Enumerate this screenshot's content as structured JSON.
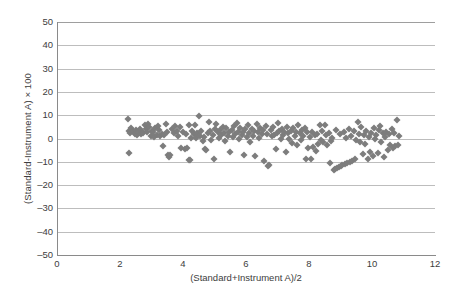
{
  "chart_data": {
    "type": "scatter",
    "title": "",
    "xlabel": "(Standard+Instrument A)/2",
    "ylabel": "(Standard-Instrument A) × 100",
    "xlim": [
      0,
      12
    ],
    "ylim": [
      -50,
      50
    ],
    "xticks": [
      0,
      2,
      4,
      6,
      8,
      10,
      12
    ],
    "yticks": [
      50,
      40,
      30,
      20,
      10,
      0,
      -10,
      -20,
      -30,
      -40,
      -50
    ],
    "xtick_labels": [
      "0",
      "2",
      "4",
      "6",
      "8",
      "10",
      "12"
    ],
    "ytick_labels": [
      "50",
      "40",
      "30",
      "20",
      "10",
      "0",
      "–10",
      "–20",
      "–30",
      "–40",
      "–50"
    ],
    "grid": "horizontal",
    "legend": "none",
    "marker": "diamond",
    "marker_color": "#7d7d7d",
    "marker_size": 5,
    "background": "#ffffff",
    "gridline_color": "#bdbdbd",
    "axis_color": "#8a8a8a",
    "n_points": 201,
    "points": [
      [
        2.25,
        8.4
      ],
      [
        2.28,
        3.1
      ],
      [
        2.31,
        2.4
      ],
      [
        2.35,
        4.6
      ],
      [
        2.3,
        -6.4
      ],
      [
        2.42,
        3.3
      ],
      [
        2.47,
        2.0
      ],
      [
        2.52,
        3.6
      ],
      [
        2.55,
        1.4
      ],
      [
        2.58,
        2.8
      ],
      [
        2.63,
        4.2
      ],
      [
        2.66,
        1.8
      ],
      [
        2.7,
        3.0
      ],
      [
        2.74,
        2.2
      ],
      [
        2.78,
        5.9
      ],
      [
        2.82,
        3.9
      ],
      [
        2.86,
        2.6
      ],
      [
        2.9,
        6.3
      ],
      [
        2.93,
        5.1
      ],
      [
        2.97,
        1.1
      ],
      [
        3.0,
        3.4
      ],
      [
        3.04,
        2.9
      ],
      [
        3.08,
        0.6
      ],
      [
        3.12,
        4.4
      ],
      [
        3.16,
        1.6
      ],
      [
        3.2,
        5.2
      ],
      [
        3.24,
        3.7
      ],
      [
        3.28,
        0.9
      ],
      [
        3.33,
        2.1
      ],
      [
        3.37,
        -3.2
      ],
      [
        3.41,
        1.3
      ],
      [
        3.45,
        6.2
      ],
      [
        3.48,
        3.0
      ],
      [
        3.52,
        -7.2
      ],
      [
        3.56,
        -7.8
      ],
      [
        3.6,
        -6.9
      ],
      [
        3.65,
        4.0
      ],
      [
        3.7,
        2.3
      ],
      [
        3.75,
        5.4
      ],
      [
        3.8,
        3.2
      ],
      [
        3.85,
        1.0
      ],
      [
        3.9,
        4.8
      ],
      [
        3.95,
        -4.0
      ],
      [
        4.0,
        2.7
      ],
      [
        4.05,
        -4.6
      ],
      [
        4.1,
        1.9
      ],
      [
        4.14,
        -4.2
      ],
      [
        4.18,
        6.0
      ],
      [
        4.2,
        -9.4
      ],
      [
        4.22,
        -9.1
      ],
      [
        4.26,
        0.2
      ],
      [
        4.3,
        3.1
      ],
      [
        4.34,
        2.0
      ],
      [
        4.38,
        5.6
      ],
      [
        4.42,
        0.4
      ],
      [
        4.46,
        2.5
      ],
      [
        4.5,
        9.5
      ],
      [
        4.54,
        1.2
      ],
      [
        4.58,
        3.3
      ],
      [
        4.62,
        -1.1
      ],
      [
        4.66,
        0.8
      ],
      [
        4.7,
        -4.4
      ],
      [
        4.74,
        -5.0
      ],
      [
        4.78,
        2.2
      ],
      [
        4.82,
        7.1
      ],
      [
        4.86,
        3.4
      ],
      [
        4.9,
        -0.6
      ],
      [
        4.94,
        1.5
      ],
      [
        4.98,
        -8.6
      ],
      [
        5.02,
        4.1
      ],
      [
        5.06,
        6.4
      ],
      [
        5.1,
        2.8
      ],
      [
        5.14,
        0.1
      ],
      [
        5.18,
        3.6
      ],
      [
        5.22,
        1.7
      ],
      [
        5.26,
        5.0
      ],
      [
        5.3,
        2.4
      ],
      [
        5.34,
        -0.9
      ],
      [
        5.38,
        4.3
      ],
      [
        5.42,
        1.0
      ],
      [
        5.46,
        2.9
      ],
      [
        5.5,
        -5.7
      ],
      [
        5.54,
        3.8
      ],
      [
        5.58,
        0.5
      ],
      [
        5.62,
        5.3
      ],
      [
        5.66,
        2.1
      ],
      [
        5.7,
        6.6
      ],
      [
        5.74,
        3.0
      ],
      [
        5.78,
        -0.3
      ],
      [
        5.82,
        4.5
      ],
      [
        5.86,
        1.4
      ],
      [
        5.9,
        2.6
      ],
      [
        5.94,
        -6.9
      ],
      [
        5.98,
        3.9
      ],
      [
        6.02,
        0.7
      ],
      [
        6.06,
        5.8
      ],
      [
        6.1,
        2.3
      ],
      [
        6.14,
        -1.6
      ],
      [
        6.18,
        4.0
      ],
      [
        6.22,
        1.1
      ],
      [
        6.26,
        3.2
      ],
      [
        6.3,
        -7.4
      ],
      [
        6.34,
        6.1
      ],
      [
        6.38,
        2.7
      ],
      [
        6.42,
        0.3
      ],
      [
        6.46,
        4.7
      ],
      [
        6.5,
        1.8
      ],
      [
        6.54,
        3.5
      ],
      [
        6.58,
        -9.8
      ],
      [
        6.62,
        5.5
      ],
      [
        6.66,
        2.0
      ],
      [
        6.7,
        -11.6
      ],
      [
        6.74,
        -11.2
      ],
      [
        6.78,
        3.7
      ],
      [
        6.82,
        0.9
      ],
      [
        6.86,
        4.9
      ],
      [
        6.9,
        1.3
      ],
      [
        6.94,
        -4.3
      ],
      [
        6.98,
        2.5
      ],
      [
        7.02,
        6.8
      ],
      [
        7.06,
        3.1
      ],
      [
        7.1,
        -0.4
      ],
      [
        7.14,
        4.2
      ],
      [
        7.18,
        1.6
      ],
      [
        7.22,
        2.8
      ],
      [
        7.26,
        -6.0
      ],
      [
        7.3,
        5.1
      ],
      [
        7.34,
        2.2
      ],
      [
        7.38,
        0.0
      ],
      [
        7.42,
        3.4
      ],
      [
        7.46,
        -1.9
      ],
      [
        7.5,
        4.6
      ],
      [
        7.54,
        1.2
      ],
      [
        7.58,
        2.9
      ],
      [
        7.62,
        -2.7
      ],
      [
        7.66,
        5.7
      ],
      [
        7.7,
        2.4
      ],
      [
        7.74,
        -0.7
      ],
      [
        7.78,
        3.8
      ],
      [
        7.82,
        1.0
      ],
      [
        7.86,
        4.4
      ],
      [
        7.9,
        -8.9
      ],
      [
        7.94,
        2.6
      ],
      [
        7.98,
        -4.1
      ],
      [
        8.02,
        0.6
      ],
      [
        8.06,
        -9.0
      ],
      [
        8.1,
        3.0
      ],
      [
        8.14,
        -3.6
      ],
      [
        8.18,
        1.5
      ],
      [
        8.22,
        -5.3
      ],
      [
        8.26,
        2.1
      ],
      [
        8.3,
        -2.2
      ],
      [
        8.34,
        6.0
      ],
      [
        8.38,
        -0.8
      ],
      [
        8.42,
        3.3
      ],
      [
        8.46,
        -1.4
      ],
      [
        8.5,
        5.9
      ],
      [
        8.54,
        1.7
      ],
      [
        8.58,
        -3.0
      ],
      [
        8.62,
        2.3
      ],
      [
        8.66,
        -10.4
      ],
      [
        8.7,
        -1.0
      ],
      [
        8.74,
        0.4
      ],
      [
        8.78,
        -13.4
      ],
      [
        8.82,
        -13.0
      ],
      [
        8.86,
        3.6
      ],
      [
        8.9,
        -12.6
      ],
      [
        8.94,
        -12.2
      ],
      [
        8.98,
        1.9
      ],
      [
        9.02,
        -11.8
      ],
      [
        9.06,
        -11.4
      ],
      [
        9.1,
        2.7
      ],
      [
        9.14,
        -11.0
      ],
      [
        9.18,
        0.2
      ],
      [
        9.22,
        -10.6
      ],
      [
        9.26,
        4.1
      ],
      [
        9.3,
        -10.2
      ],
      [
        9.34,
        1.1
      ],
      [
        9.38,
        -9.6
      ],
      [
        9.42,
        3.4
      ],
      [
        9.46,
        -8.8
      ],
      [
        9.5,
        -0.5
      ],
      [
        9.54,
        6.9
      ],
      [
        9.58,
        2.0
      ],
      [
        9.62,
        -1.7
      ],
      [
        9.66,
        4.8
      ],
      [
        9.7,
        -6.6
      ],
      [
        9.74,
        1.4
      ],
      [
        9.78,
        -2.4
      ],
      [
        9.82,
        3.1
      ],
      [
        9.86,
        -9.0
      ],
      [
        9.9,
        0.8
      ],
      [
        9.94,
        -5.6
      ],
      [
        9.98,
        2.5
      ],
      [
        10.02,
        -7.7
      ],
      [
        10.06,
        4.3
      ],
      [
        10.1,
        -0.2
      ],
      [
        10.14,
        1.6
      ],
      [
        10.18,
        -6.2
      ],
      [
        10.22,
        3.7
      ],
      [
        10.26,
        5.4
      ],
      [
        10.3,
        -1.3
      ],
      [
        10.34,
        2.2
      ],
      [
        10.38,
        -7.9
      ],
      [
        10.42,
        0.5
      ],
      [
        10.46,
        3.0
      ],
      [
        10.5,
        -4.9
      ],
      [
        10.54,
        1.8
      ],
      [
        10.58,
        -2.8
      ],
      [
        10.62,
        4.0
      ],
      [
        10.66,
        -4.0
      ],
      [
        10.7,
        2.4
      ],
      [
        10.74,
        -3.4
      ],
      [
        10.78,
        8.0
      ],
      [
        10.82,
        -2.9
      ],
      [
        10.86,
        1.2
      ]
    ]
  },
  "figure": {
    "caption": ""
  }
}
